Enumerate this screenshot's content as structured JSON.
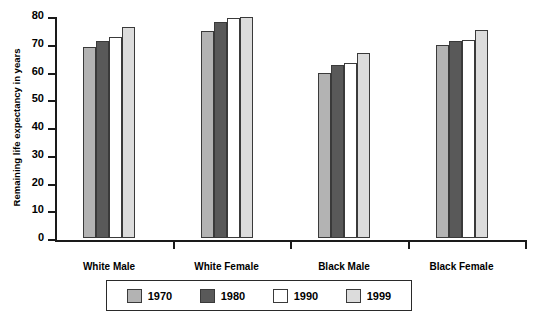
{
  "chart_data": {
    "type": "bar",
    "title": "",
    "xlabel": "",
    "ylabel": "Remaining life expectancy in years",
    "ylim": [
      0,
      80
    ],
    "yticks": [
      0,
      10,
      20,
      30,
      40,
      50,
      60,
      70,
      80
    ],
    "grid": false,
    "legend_position": "bottom",
    "categories": [
      "White Male",
      "White Female",
      "Black Male",
      "Black Female"
    ],
    "series": [
      {
        "name": "1970",
        "color": "#b3b3b3",
        "values": [
          69.0,
          74.5,
          59.3,
          69.4
        ]
      },
      {
        "name": "1980",
        "color": "#595959",
        "values": [
          71.0,
          78.0,
          62.4,
          70.9
        ]
      },
      {
        "name": "1990",
        "color": "#ffffff",
        "values": [
          72.6,
          79.4,
          63.2,
          71.3
        ]
      },
      {
        "name": "1999",
        "color": "#dcdcdc",
        "values": [
          76.0,
          79.8,
          66.6,
          74.8
        ]
      }
    ]
  },
  "axis": {
    "y_label": "Remaining life expectancy in years",
    "y_tick_labels": [
      "80",
      "70",
      "60",
      "50",
      "40",
      "30",
      "20",
      "10",
      "0"
    ]
  },
  "legend": {
    "entries": [
      {
        "label": "1970"
      },
      {
        "label": "1980"
      },
      {
        "label": "1990"
      },
      {
        "label": "1999"
      }
    ]
  }
}
